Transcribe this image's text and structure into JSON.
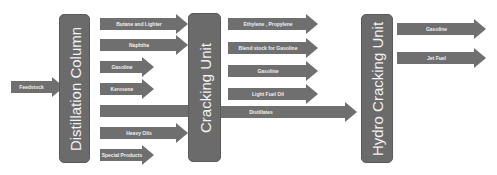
{
  "diagram": {
    "feedstock": "Feedstock",
    "units": {
      "distillation": "Distillation Column",
      "cracking": "Cracking Unit",
      "hydrocracking": "Hydro Cracking Unit"
    },
    "distillation_outputs": [
      "Butane and Lighter",
      "Naphtha",
      "Gasoline",
      "Kerosene",
      "",
      "Heavy Oils",
      "Special Products"
    ],
    "cracking_outputs": [
      "Ethylene , Propylene",
      "Blend stock for Gasoline",
      "Gasoline",
      "Light Fuel Oil"
    ],
    "distillates": "Distillates",
    "hydrocracking_outputs": [
      "Gasoline",
      "Jet Fuel"
    ],
    "colors": {
      "box": "#6b6b6b",
      "arrow": "#6f6f6f",
      "text": "#f2f2f2"
    }
  }
}
